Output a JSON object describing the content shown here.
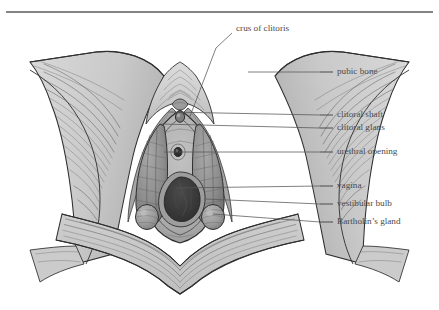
{
  "figure": {
    "orientation": "anterior-superior view, pubic symphysis at top",
    "top_rule": true
  },
  "colors": {
    "page_background": "#ffffff",
    "tissue_light": "#d2d2d2",
    "tissue_mid": "#b9b9b9",
    "tissue_dark": "#9a9a9a",
    "bulb_fill": "#8e8e8e",
    "vestibule_fill": "#b0b0b0",
    "vagina_dark": "#3a3a3a",
    "ink_line": "#2e2e2e",
    "label_text": "#4a4a4a",
    "leader_line": "#555555",
    "rule_color": "#5a5a5a"
  },
  "labels": [
    {
      "id": "crus-of-clitoris",
      "text": "crus of clitoris",
      "text_x": 236,
      "text_y": 29,
      "side": "top",
      "leader_points": "232,33 216,48 189,119",
      "target_x": 189,
      "target_y": 119
    },
    {
      "id": "pubic-bone",
      "text": "pubic bone",
      "text_x": 337,
      "text_y": 72,
      "side": "right",
      "dash_x1": 320,
      "dash_x2": 333,
      "leader_points": "320,72 248,72",
      "target_x": 248,
      "target_y": 72
    },
    {
      "id": "clitoral-shaft",
      "text": "clitoral shaft",
      "text_x": 337,
      "text_y": 115,
      "side": "right",
      "dash_x1": 320,
      "dash_x2": 333,
      "leader_points": "320,115 168,112",
      "target_x": 168,
      "target_y": 112
    },
    {
      "id": "clitoral-glans",
      "text": "clitoral glans",
      "text_x": 337,
      "text_y": 128,
      "side": "right",
      "dash_x1": 320,
      "dash_x2": 333,
      "leader_points": "320,128 162,124",
      "target_x": 162,
      "target_y": 124
    },
    {
      "id": "urethral-opening",
      "text": "urethral opening",
      "text_x": 337,
      "text_y": 152,
      "side": "right",
      "dash_x1": 320,
      "dash_x2": 333,
      "leader_points": "320,152 164,152",
      "target_x": 164,
      "target_y": 152
    },
    {
      "id": "vagina",
      "text": "vagina",
      "text_x": 337,
      "text_y": 186,
      "side": "right",
      "dash_x1": 320,
      "dash_x2": 333,
      "leader_points": "320,186 175,188",
      "target_x": 175,
      "target_y": 188
    },
    {
      "id": "vestibular-bulb",
      "text": "vestibular bulb",
      "text_x": 337,
      "text_y": 204,
      "side": "right",
      "dash_x1": 320,
      "dash_x2": 333,
      "leader_points": "320,204 205,199",
      "target_x": 205,
      "target_y": 199
    },
    {
      "id": "bartholins-gland",
      "text": "Bartholin’s gland",
      "text_x": 337,
      "text_y": 222,
      "side": "right",
      "dash_x1": 320,
      "dash_x2": 333,
      "leader_points": "320,222 213,214",
      "target_x": 213,
      "target_y": 214
    }
  ],
  "structures": [
    {
      "id": "pubic-bone-left",
      "name": "left pubic ramus"
    },
    {
      "id": "pubic-bone-right",
      "name": "right pubic ramus"
    },
    {
      "id": "clitoral-shaft",
      "name": "clitoral shaft"
    },
    {
      "id": "clitoral-glans",
      "name": "clitoral glans"
    },
    {
      "id": "crus-left",
      "name": "left crus of clitoris"
    },
    {
      "id": "crus-right",
      "name": "right crus of clitoris"
    },
    {
      "id": "vestibular-bulb-left",
      "name": "left vestibular bulb"
    },
    {
      "id": "vestibular-bulb-right",
      "name": "right vestibular bulb"
    },
    {
      "id": "bartholin-gland-left",
      "name": "left Bartholin’s gland"
    },
    {
      "id": "bartholin-gland-right",
      "name": "right Bartholin’s gland"
    },
    {
      "id": "urethral-opening",
      "name": "urethral opening"
    },
    {
      "id": "vaginal-opening",
      "name": "vaginal opening"
    },
    {
      "id": "perineal-body",
      "name": "perineal body"
    },
    {
      "id": "vestibule",
      "name": "vestibule"
    }
  ]
}
